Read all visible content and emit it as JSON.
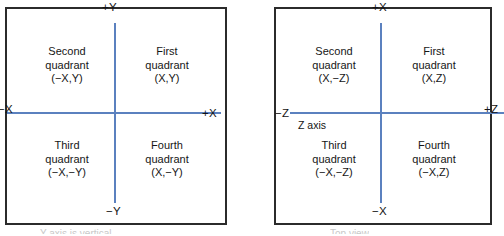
{
  "figure": {
    "background_color": "#ffffff",
    "axis_color": "#5b81bf",
    "frame_color": "#2b2b2b",
    "text_color": "#161616"
  },
  "diagrams": [
    {
      "id": "xy-plane",
      "name": "X-Y plane quadrants",
      "axes": {
        "vertical_positive": "+Y",
        "vertical_negative": "−Y",
        "horizontal_negative": "−X",
        "horizontal_positive": "+X",
        "note": ""
      },
      "quadrants": {
        "second": "Second\nquadrant\n(−X,Y)",
        "first": "First\nquadrant\n(X,Y)",
        "third": "Third\nquadrant\n(−X,−Y)",
        "fourth": "Fourth\nquadrant\n(X,−Y)"
      },
      "caption_partial": "Y axis is vertical"
    },
    {
      "id": "xz-plane",
      "name": "X-Z plane quadrants",
      "axes": {
        "vertical_positive": "+X",
        "vertical_negative": "−X",
        "horizontal_negative": "−Z",
        "horizontal_positive": "+Z",
        "note": "Z axis"
      },
      "quadrants": {
        "second": "Second\nquadrant\n(X,−Z)",
        "first": "First\nquadrant\n(X,Z)",
        "third": "Third\nquadrant\n(−X,−Z)",
        "fourth": "Fourth\nquadrant\n(−X,Z)"
      },
      "caption_partial": "Top view"
    }
  ]
}
